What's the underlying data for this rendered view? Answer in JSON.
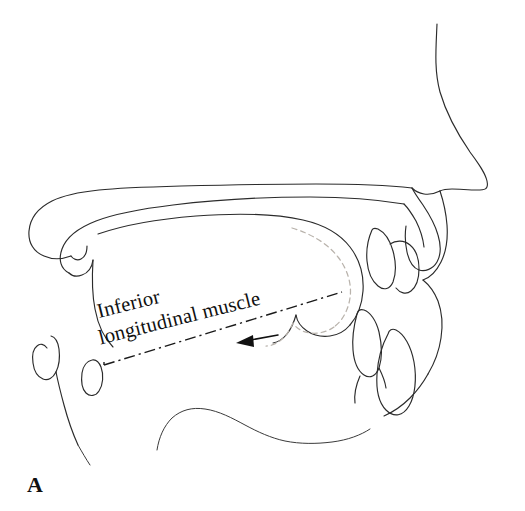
{
  "figure": {
    "panel_letter": "A",
    "background_color": "#ffffff",
    "ink_color": "#2b2b2b",
    "ghost_outline_color": "#b9b3ac",
    "annotation": {
      "label_line_1": "Inferior",
      "label_line_2": "longitudinal muscle",
      "label_full": "Inferior longitudinal muscle",
      "label_rotation_degrees": -14,
      "leader_line_style": "dash-dot",
      "arrow_direction": "left",
      "arrow_color": "#111111"
    },
    "structures": [
      {
        "name": "nose-profile",
        "label": "nose profile"
      },
      {
        "name": "upper-lip",
        "label": "upper lip"
      },
      {
        "name": "lower-lip",
        "label": "lower lip"
      },
      {
        "name": "hard-palate",
        "label": "hard palate"
      },
      {
        "name": "soft-palate",
        "label": "soft palate"
      },
      {
        "name": "uvula",
        "label": "uvula"
      },
      {
        "name": "tongue-body",
        "label": "tongue body"
      },
      {
        "name": "tongue-alternate-position",
        "label": "tongue alternate position"
      },
      {
        "name": "lower-incisor",
        "label": "lower incisor"
      },
      {
        "name": "epiglottis",
        "label": "epiglottis"
      },
      {
        "name": "pharyngeal-wall",
        "label": "pharyngeal wall"
      },
      {
        "name": "floor-of-mouth",
        "label": "floor of mouth"
      },
      {
        "name": "mandible-contour",
        "label": "mandible contour"
      }
    ]
  }
}
